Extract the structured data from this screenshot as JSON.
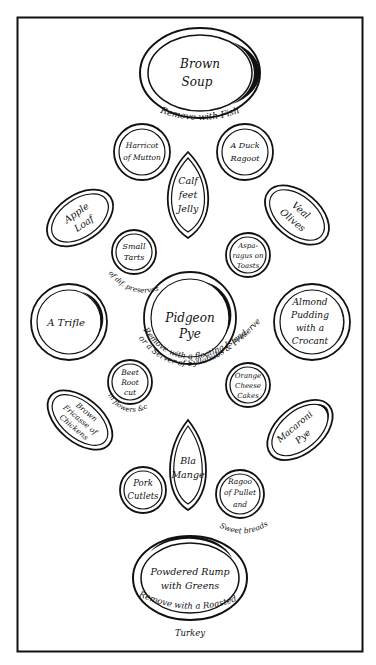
{
  "colors": {
    "ink": "#111111",
    "paper": "#ffffff"
  },
  "dishes": [
    {
      "id": "brown-soup",
      "lines": [
        "Brown",
        "Soup"
      ],
      "note": "Remove with Fish"
    },
    {
      "id": "harricot-of-mutton",
      "lines": [
        "Harricot",
        "of Mutton"
      ]
    },
    {
      "id": "a-duck-ragoot",
      "lines": [
        "A Duck",
        "Ragoot"
      ]
    },
    {
      "id": "calf-feet-jelly",
      "lines": [
        "Calf",
        "feet",
        "Jelly"
      ]
    },
    {
      "id": "apple-loaf",
      "lines": [
        "Apple",
        "Loaf"
      ]
    },
    {
      "id": "veal-olives",
      "lines": [
        "Veal",
        "Olives"
      ]
    },
    {
      "id": "small-tarts",
      "lines": [
        "Small",
        "Tarts"
      ],
      "note": "of dif. preserves"
    },
    {
      "id": "asparagus-on-toasts",
      "lines": [
        "Aspa-",
        "ragus on",
        "Toasts"
      ]
    },
    {
      "id": "a-trifle",
      "lines": [
        "A Trifle"
      ]
    },
    {
      "id": "pidgeon-pye",
      "lines": [
        "Pidgeon",
        "Pye"
      ],
      "note": "Remove with a floating Island",
      "note2": "or a Server of Syllabubs & Preserves"
    },
    {
      "id": "almond-pudding",
      "lines": [
        "Almond",
        "Pudding",
        "with a",
        "Crocant"
      ]
    },
    {
      "id": "beet-root",
      "lines": [
        "Beet",
        "Root",
        "cut"
      ],
      "note": "in flowers &c"
    },
    {
      "id": "orange-cheese-cakes",
      "lines": [
        "Orange",
        "Cheese",
        "Cakes"
      ]
    },
    {
      "id": "brown-fricasee",
      "lines": [
        "Brown",
        "Fricasse of",
        "Chickens"
      ]
    },
    {
      "id": "macaroni-pye",
      "lines": [
        "Macaroni",
        "Pye"
      ]
    },
    {
      "id": "bla-mange",
      "lines": [
        "Bla",
        "Mange"
      ]
    },
    {
      "id": "pork-cutlets",
      "lines": [
        "Pork",
        "Cutlets"
      ]
    },
    {
      "id": "ragoo-of-pullet",
      "lines": [
        "Ragoo",
        "of Pullet",
        "and"
      ],
      "note": "Sweet breads"
    },
    {
      "id": "powdered-rump",
      "lines": [
        "Powdered Rump",
        "with Greens"
      ],
      "note": "Remove with a Roasted",
      "note2": "Turkey"
    }
  ]
}
